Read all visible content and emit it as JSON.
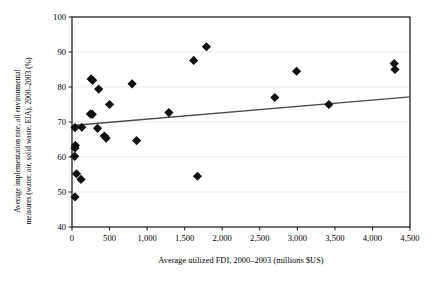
{
  "chart_data": {
    "type": "scatter",
    "title": "",
    "xlabel": "Average utilized FDI, 2000–2003 (millions $US)",
    "ylabel": "Average implementation rate, all environmental\nmeasures (water, air, solid waste, EIA), 2000–2003 (%)",
    "xlim": [
      0,
      4500
    ],
    "ylim": [
      40,
      100
    ],
    "xticks": [
      0,
      500,
      1000,
      1500,
      2000,
      2500,
      3000,
      3500,
      4000,
      4500
    ],
    "xticklabels": [
      "0",
      "500",
      "1,000",
      "1,500",
      "2,000",
      "2,500",
      "3,000",
      "3,500",
      "4,000",
      "4,500"
    ],
    "yticks": [
      40,
      50,
      60,
      70,
      80,
      90,
      100
    ],
    "yticklabels": [
      "40",
      "50",
      "60",
      "70",
      "80",
      "90",
      "100"
    ],
    "grid": "horizontal",
    "grid_color": "#e3e3e3",
    "marker": "diamond",
    "marker_color": "#111111",
    "marker_size": 4.6,
    "legend": "none",
    "points": [
      {
        "x": 40,
        "y": 68.4
      },
      {
        "x": 45,
        "y": 63.3
      },
      {
        "x": 40,
        "y": 62.6
      },
      {
        "x": 35,
        "y": 60.2
      },
      {
        "x": 60,
        "y": 55.2
      },
      {
        "x": 120,
        "y": 53.6
      },
      {
        "x": 40,
        "y": 48.6
      },
      {
        "x": 130,
        "y": 68.5
      },
      {
        "x": 245,
        "y": 72.3
      },
      {
        "x": 270,
        "y": 72.2
      },
      {
        "x": 255,
        "y": 82.3
      },
      {
        "x": 275,
        "y": 81.9
      },
      {
        "x": 340,
        "y": 68.2
      },
      {
        "x": 355,
        "y": 79.4
      },
      {
        "x": 430,
        "y": 66.0
      },
      {
        "x": 455,
        "y": 65.4
      },
      {
        "x": 500,
        "y": 75.0
      },
      {
        "x": 800,
        "y": 80.9
      },
      {
        "x": 860,
        "y": 64.7
      },
      {
        "x": 1290,
        "y": 72.7
      },
      {
        "x": 1620,
        "y": 87.6
      },
      {
        "x": 1670,
        "y": 54.5
      },
      {
        "x": 1790,
        "y": 91.5
      },
      {
        "x": 2700,
        "y": 77.0
      },
      {
        "x": 2990,
        "y": 84.5
      },
      {
        "x": 3420,
        "y": 75.0
      },
      {
        "x": 4290,
        "y": 86.7
      },
      {
        "x": 4300,
        "y": 85.0
      }
    ],
    "trendline": {
      "type": "linear",
      "color": "#4a4a4a",
      "x_start": 0,
      "y_start": 69.0,
      "x_end": 4500,
      "y_end": 77.2
    },
    "axis_color": "#1a1a1a",
    "background": "#ffffff"
  }
}
